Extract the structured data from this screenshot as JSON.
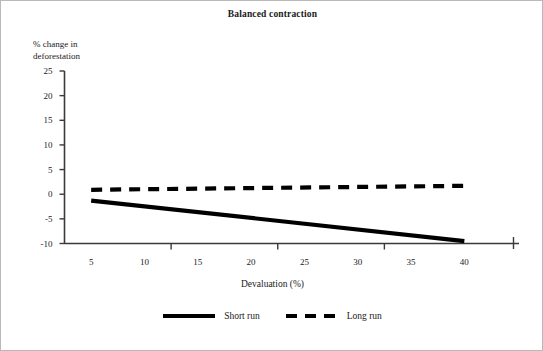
{
  "chart_data": {
    "type": "line",
    "title": "Balanced contraction",
    "xlabel": "Devaluation (%)",
    "ylabel": "% change in\ndeforestation",
    "xlim": [
      2.5,
      42.5
    ],
    "ylim": [
      -10,
      25
    ],
    "grid": false,
    "legend_position": "bottom-center",
    "x_ticks": [
      5,
      10,
      15,
      20,
      25,
      30,
      35,
      40
    ],
    "x_tick_labels": [
      "5",
      "10",
      "15",
      "20",
      "25",
      "30",
      "35",
      "40"
    ],
    "x_tick_marks": [
      12.5,
      22.5,
      32.5
    ],
    "y_ticks": [
      25,
      20,
      15,
      10,
      5,
      0,
      -5,
      -10
    ],
    "y_tick_labels": [
      "25",
      "20",
      "15",
      "10",
      "5",
      "0",
      "-5",
      "-10"
    ],
    "x": [
      5,
      40
    ],
    "series": [
      {
        "name": "Short run",
        "style": "solid",
        "color": "#000000",
        "values": [
          -1.3,
          -9.5
        ]
      },
      {
        "name": "Long run",
        "style": "dashed",
        "color": "#000000",
        "values": [
          0.9,
          1.7
        ]
      }
    ]
  },
  "legend": {
    "items": [
      {
        "label": "Short run",
        "style": "solid"
      },
      {
        "label": "Long run",
        "style": "dashed"
      }
    ]
  }
}
